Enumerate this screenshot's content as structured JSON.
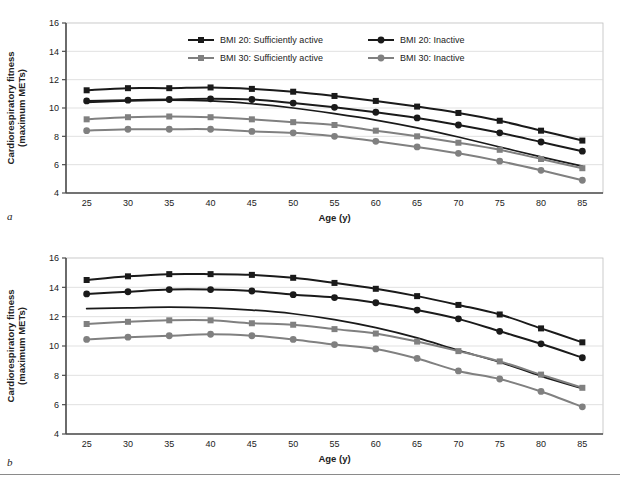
{
  "figure": {
    "panel_a_letter": "a",
    "panel_b_letter": "b"
  },
  "legend": {
    "items": [
      {
        "label": "BMI 20: Sufficiently active",
        "color": "#1a1a1a",
        "marker": "square"
      },
      {
        "label": "BMI 20: Inactive",
        "color": "#1a1a1a",
        "marker": "circle"
      },
      {
        "label": "BMI 30: Sufficiently active",
        "color": "#808080",
        "marker": "square"
      },
      {
        "label": "BMI 30: Inactive",
        "color": "#808080",
        "marker": "circle"
      }
    ]
  },
  "chart_data": [
    {
      "panel": "a",
      "type": "line",
      "title": "",
      "xlabel": "Age (y)",
      "ylabel": "Cardiorespiratory fitness (maximum METs)",
      "xlim": [
        22.5,
        87.5
      ],
      "ylim": [
        4,
        16
      ],
      "xticks": [
        25,
        30,
        35,
        40,
        45,
        50,
        55,
        60,
        65,
        70,
        75,
        80,
        85
      ],
      "yticks": [
        4,
        6,
        8,
        10,
        12,
        14,
        16
      ],
      "grid": "horizontal",
      "legend_position": "top-center",
      "x": [
        25,
        30,
        35,
        40,
        45,
        50,
        55,
        60,
        65,
        70,
        75,
        80,
        85
      ],
      "series": [
        {
          "name": "BMI 20: Sufficiently active",
          "color": "#1a1a1a",
          "marker": "square",
          "values": [
            11.25,
            11.4,
            11.4,
            11.45,
            11.35,
            11.15,
            10.85,
            10.5,
            10.1,
            9.65,
            9.1,
            8.4,
            7.7
          ]
        },
        {
          "name": "BMI 20: Inactive",
          "color": "#1a1a1a",
          "marker": "circle",
          "values": [
            10.5,
            10.55,
            10.6,
            10.65,
            10.6,
            10.35,
            10.05,
            9.7,
            9.3,
            8.8,
            8.25,
            7.6,
            6.95
          ]
        },
        {
          "name": "unlabeled reference line",
          "color": "#1a1a1a",
          "marker": "none",
          "values": [
            10.4,
            10.5,
            10.55,
            10.5,
            10.3,
            10.0,
            9.6,
            9.15,
            8.6,
            7.95,
            7.25,
            6.55,
            5.9
          ]
        },
        {
          "name": "BMI 30: Sufficiently active",
          "color": "#808080",
          "marker": "square",
          "values": [
            9.2,
            9.35,
            9.4,
            9.35,
            9.2,
            9.0,
            8.8,
            8.4,
            8.0,
            7.55,
            7.05,
            6.4,
            5.75
          ]
        },
        {
          "name": "BMI 30: Inactive",
          "color": "#808080",
          "marker": "circle",
          "values": [
            8.4,
            8.5,
            8.5,
            8.5,
            8.35,
            8.25,
            8.0,
            7.65,
            7.25,
            6.8,
            6.25,
            5.6,
            4.9
          ]
        }
      ]
    },
    {
      "panel": "b",
      "type": "line",
      "title": "",
      "xlabel": "Age (y)",
      "ylabel": "Cardiorespiratory fitness (maximum METs)",
      "xlim": [
        22.5,
        87.5
      ],
      "ylim": [
        4,
        16
      ],
      "xticks": [
        25,
        30,
        35,
        40,
        45,
        50,
        55,
        60,
        65,
        70,
        75,
        80,
        85
      ],
      "yticks": [
        4,
        6,
        8,
        10,
        12,
        14,
        16
      ],
      "grid": "horizontal",
      "legend_position": "none",
      "x": [
        25,
        30,
        35,
        40,
        45,
        50,
        55,
        60,
        65,
        70,
        75,
        80,
        85
      ],
      "series": [
        {
          "name": "BMI 20: Sufficiently active",
          "color": "#1a1a1a",
          "marker": "square",
          "values": [
            14.5,
            14.75,
            14.9,
            14.9,
            14.85,
            14.65,
            14.3,
            13.9,
            13.4,
            12.8,
            12.15,
            11.2,
            10.25
          ]
        },
        {
          "name": "BMI 20: Inactive",
          "color": "#1a1a1a",
          "marker": "circle",
          "values": [
            13.55,
            13.7,
            13.85,
            13.85,
            13.75,
            13.5,
            13.3,
            12.95,
            12.45,
            11.85,
            11.0,
            10.15,
            9.2
          ]
        },
        {
          "name": "unlabeled reference line",
          "color": "#1a1a1a",
          "marker": "none",
          "values": [
            12.55,
            12.6,
            12.65,
            12.6,
            12.45,
            12.2,
            11.8,
            11.25,
            10.55,
            9.7,
            8.9,
            7.95,
            7.1
          ]
        },
        {
          "name": "BMI 30: Sufficiently active",
          "color": "#808080",
          "marker": "square",
          "values": [
            11.5,
            11.65,
            11.75,
            11.75,
            11.55,
            11.45,
            11.15,
            10.85,
            10.3,
            9.65,
            8.95,
            8.05,
            7.15
          ]
        },
        {
          "name": "BMI 30: Inactive",
          "color": "#808080",
          "marker": "circle",
          "values": [
            10.45,
            10.6,
            10.7,
            10.8,
            10.7,
            10.45,
            10.1,
            9.8,
            9.15,
            8.3,
            7.75,
            6.9,
            5.85
          ]
        }
      ]
    }
  ]
}
